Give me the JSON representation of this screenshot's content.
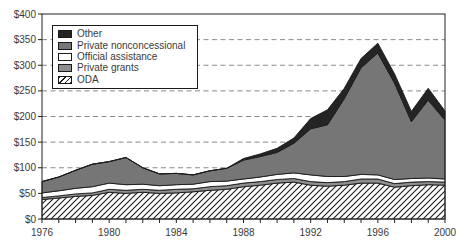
{
  "chart_data": {
    "type": "area",
    "stacked": true,
    "title": "",
    "x": [
      1976,
      1977,
      1978,
      1979,
      1980,
      1981,
      1982,
      1983,
      1984,
      1985,
      1986,
      1987,
      1988,
      1989,
      1990,
      1991,
      1992,
      1993,
      1994,
      1995,
      1996,
      1997,
      1998,
      1999,
      2000
    ],
    "x_axis": {
      "tick_labels": [
        "1976",
        "1980",
        "1984",
        "1988",
        "1992",
        "1996",
        "2000"
      ],
      "label_every_years": 4,
      "minor_tick_every_years": 1
    },
    "y_axis": {
      "min": 0,
      "max": 400,
      "tick_step": 50,
      "tick_labels": [
        "$0",
        "$50",
        "$100",
        "$150",
        "$200",
        "$250",
        "$300",
        "$350",
        "$400"
      ],
      "grid_values": [
        100,
        150,
        200,
        250,
        300,
        350
      ],
      "grid_style": "dashed"
    },
    "series": [
      {
        "name": "ODA",
        "fill": "hatch",
        "values": [
          38,
          41,
          44,
          46,
          52,
          50,
          52,
          50,
          51,
          53,
          56,
          58,
          63,
          66,
          70,
          72,
          66,
          64,
          66,
          70,
          70,
          62,
          65,
          67,
          66
        ]
      },
      {
        "name": "Private grants",
        "fill": "#8e8e8e",
        "values": [
          4,
          4,
          5,
          5,
          6,
          6,
          6,
          6,
          7,
          6,
          7,
          7,
          7,
          7,
          7,
          7,
          7,
          7,
          7,
          8,
          8,
          7,
          7,
          6,
          6
        ]
      },
      {
        "name": "Official assistance",
        "fill": "#ffffff",
        "values": [
          9,
          10,
          11,
          12,
          12,
          11,
          10,
          9,
          9,
          9,
          10,
          9,
          8,
          9,
          10,
          11,
          13,
          12,
          10,
          9,
          8,
          8,
          7,
          7,
          6
        ]
      },
      {
        "name": "Private nonconcessional",
        "fill": "#767676",
        "values": [
          22,
          27,
          35,
          44,
          42,
          53,
          32,
          23,
          22,
          18,
          21,
          25,
          37,
          40,
          43,
          58,
          90,
          101,
          152,
          208,
          238,
          188,
          111,
          152,
          115
        ]
      },
      {
        "name": "Other",
        "fill": "#242424",
        "values": [
          0,
          0,
          0,
          0,
          0,
          0,
          0,
          0,
          0,
          0,
          0,
          0,
          3,
          5,
          8,
          10,
          20,
          29,
          20,
          18,
          19,
          18,
          20,
          23,
          18
        ]
      }
    ],
    "legend": {
      "position": "top-left",
      "items": [
        {
          "label": "Other",
          "swatch": "solid-black"
        },
        {
          "label": "Private nonconcessional",
          "swatch": "solid-dark-gray"
        },
        {
          "label": "Official assistance",
          "swatch": "solid-white"
        },
        {
          "label": "Private grants",
          "swatch": "solid-gray"
        },
        {
          "label": "ODA",
          "swatch": "diagonal-hatch"
        }
      ]
    },
    "style": {
      "background": "#ffffff",
      "plot_border": "#222222",
      "outline": "#1a1a1a",
      "grid_color": "#8a8a8a",
      "tick_label_color": "#3a3a3a",
      "hatch_line": "#1a1a1a"
    }
  }
}
